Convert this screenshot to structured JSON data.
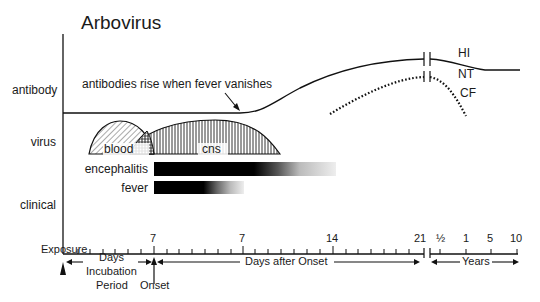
{
  "title": "Arbovirus",
  "row_labels": {
    "antibody": "antibody",
    "virus": "virus",
    "clinical": "clinical"
  },
  "annotations": {
    "antibody_rise": "antibodies rise when fever vanishes"
  },
  "antibody_curves": [
    {
      "label": "HI",
      "style": "solid"
    },
    {
      "label": "NT",
      "style": "solid"
    },
    {
      "label": "CF",
      "style": "dotted"
    }
  ],
  "virus_regions": [
    {
      "label": "blood",
      "pattern": "diagonal-hatch"
    },
    {
      "label": "cns",
      "pattern": "vertical-hatch"
    }
  ],
  "clinical_bars": [
    {
      "label": "encephalitis"
    },
    {
      "label": "fever"
    }
  ],
  "x_axis": {
    "tick_labels": [
      "7",
      "7",
      "14",
      "21",
      "½",
      "1",
      "5",
      "10"
    ],
    "markers": {
      "exposure": "Exposure",
      "onset": "Onset"
    },
    "spans": {
      "incubation_line1": "Days",
      "incubation_line2": "Incubation",
      "incubation_line3": "Period",
      "after_onset": "Days after Onset",
      "years": "Years"
    }
  }
}
